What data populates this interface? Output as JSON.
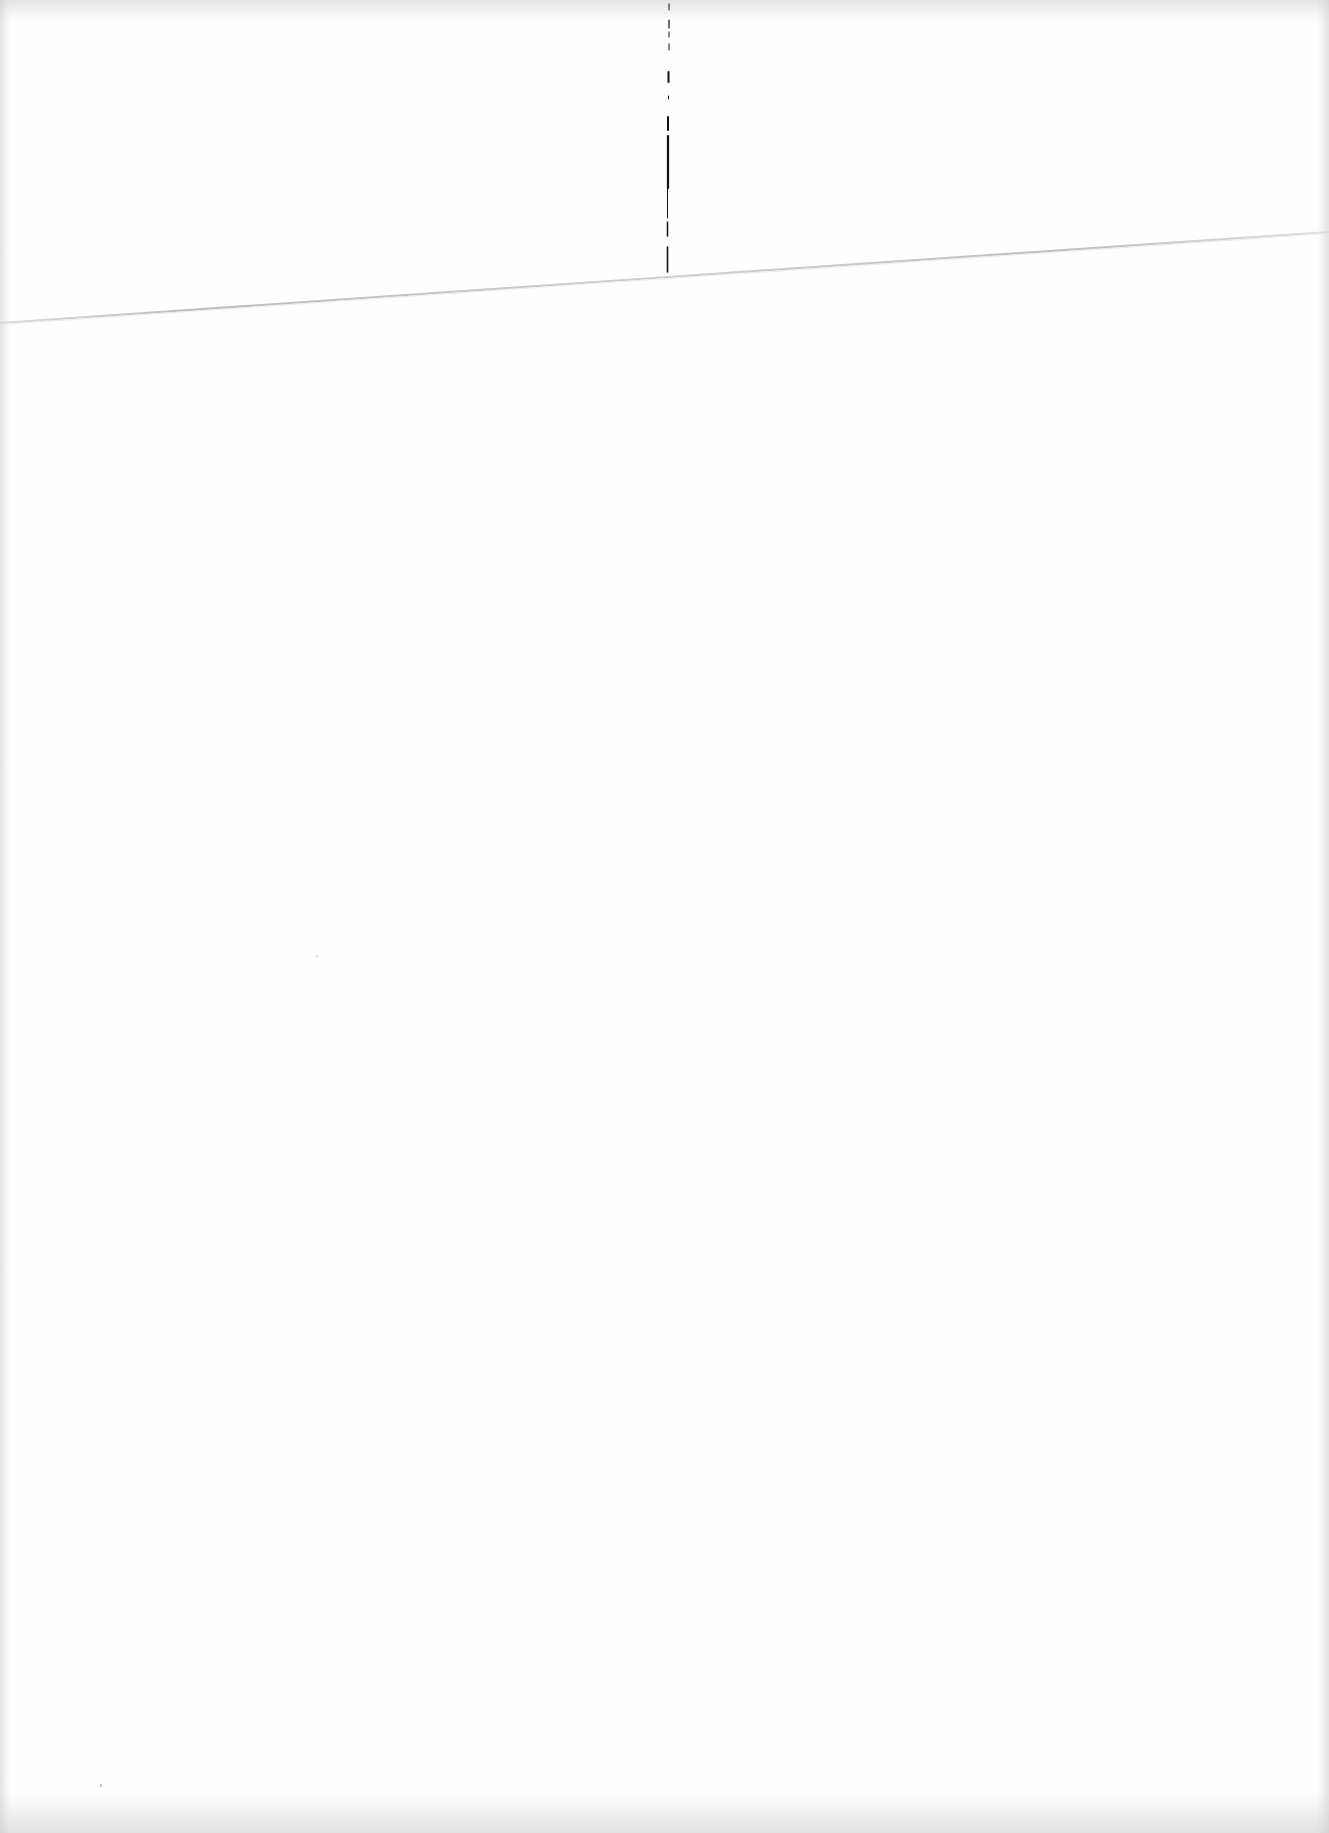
{
  "document": {
    "type": "scanned blank page",
    "text": "",
    "background_color": "#fefefe",
    "marks": {
      "fold_crease": {
        "description": "faint diagonal crease line",
        "from": [
          0,
          322
        ],
        "to": [
          1329,
          232
        ],
        "color": "#bdbdbd"
      },
      "ink_mark": {
        "description": "vertical broken ink line",
        "x": 668,
        "y_start": 0,
        "y_end": 272,
        "color": "#111111"
      }
    }
  }
}
